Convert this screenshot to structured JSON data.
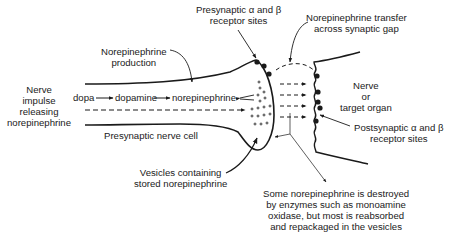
{
  "diagram": {
    "type": "synapse-schematic",
    "labels": {
      "presynaptic_receptors": [
        "Presynaptic α and β",
        "receptor sites"
      ],
      "transfer": [
        "Norepinephrine transfer",
        "across synaptic gap"
      ],
      "production": [
        "Norepinephrine",
        "production"
      ],
      "nerve_impulse": [
        "Nerve",
        "impulse",
        "releasing",
        "norepinephrine"
      ],
      "target": [
        "Nerve",
        "or",
        "target organ"
      ],
      "presynaptic_cell": "Presynaptic nerve cell",
      "postsynaptic_receptors": [
        "Postsynaptic α and β",
        "receptor sites"
      ],
      "vesicles": [
        "Vesicles containing",
        "stored norepinephrine"
      ],
      "enzymes": [
        "Some norepinephrine is destroyed",
        "by enzymes such as monoamine",
        "oxidase, but most is reabsorbed",
        "and repackaged in the vesicles"
      ]
    },
    "pathway": {
      "step1": "dopa",
      "step2": "dopamine",
      "step3": "norepinephrine"
    },
    "colors": {
      "ink": "#1a1a1a",
      "background": "#ffffff"
    }
  }
}
